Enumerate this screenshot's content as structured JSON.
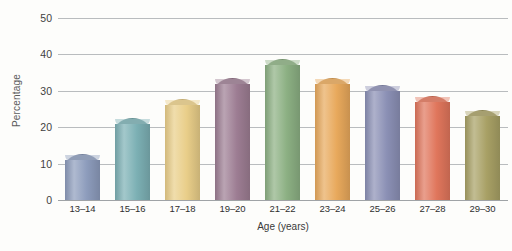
{
  "chart_data": {
    "type": "bar",
    "title": "",
    "xlabel": "Age (years)",
    "ylabel": "Percentage",
    "categories": [
      "13–14",
      "15–16",
      "17–18",
      "19–20",
      "21–22",
      "23–24",
      "25–26",
      "27–28",
      "29–30"
    ],
    "values": [
      11,
      21,
      26,
      32,
      37,
      32,
      30,
      27,
      23
    ],
    "ylim": [
      0,
      50
    ],
    "yticks": [
      0,
      10,
      20,
      30,
      40,
      50
    ],
    "ytick_labels": [
      "0",
      "10",
      "20",
      "30",
      "40",
      "50"
    ],
    "grid": true,
    "legend": "none",
    "bar_colors": [
      "#8d9cbc",
      "#7cb0b4",
      "#e9ce89",
      "#9d7d93",
      "#8cb083",
      "#e8a95c",
      "#8b90b5",
      "#e0765c",
      "#a8a065"
    ],
    "bar_colors_light": [
      "#b4bed4",
      "#a6cacd",
      "#f3e2b4",
      "#bda4b5",
      "#b0ca a9",
      "#f2c894",
      "#b0b4cd",
      "#eda08c",
      "#c4bd92"
    ]
  },
  "axes": {
    "y_title": "Percentage",
    "x_title": "Age (years)"
  }
}
